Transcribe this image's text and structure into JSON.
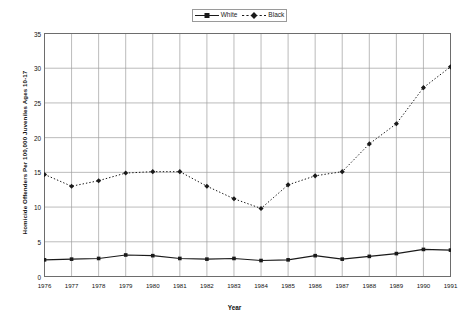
{
  "chart_data": {
    "type": "line",
    "title": "",
    "xlabel": "Year",
    "ylabel": "Homicide Offenders Per 100,000 Juveniles Ages 10-17",
    "categories": [
      1976,
      1977,
      1978,
      1979,
      1980,
      1981,
      1982,
      1983,
      1984,
      1985,
      1986,
      1987,
      1988,
      1989,
      1990,
      1991
    ],
    "xlim": [
      1976,
      1991
    ],
    "ylim": [
      0,
      35
    ],
    "yticks": [
      0,
      5,
      10,
      15,
      20,
      25,
      30,
      35
    ],
    "xticks": [
      "1976",
      "1977",
      "1978",
      "1979",
      "1980",
      "1981",
      "1982",
      "1983",
      "1984",
      "1985",
      "1986",
      "1987",
      "1988",
      "1989",
      "1990",
      "1991"
    ],
    "grid": "both",
    "legend_position": "top-center",
    "series": [
      {
        "name": "White",
        "line_style": "solid",
        "marker": "square",
        "color": "#1a1a1a",
        "values": [
          2.4,
          2.5,
          2.6,
          3.1,
          3.0,
          2.6,
          2.5,
          2.6,
          2.3,
          2.4,
          3.0,
          2.5,
          2.9,
          3.3,
          3.9,
          3.8
        ]
      },
      {
        "name": "Black",
        "line_style": "dotted",
        "marker": "diamond",
        "color": "#1a1a1a",
        "values": [
          14.7,
          13.0,
          13.8,
          14.9,
          15.1,
          15.1,
          13.0,
          11.2,
          9.8,
          13.2,
          14.5,
          15.1,
          19.1,
          22.0,
          27.2,
          30.2
        ]
      }
    ]
  },
  "legend": {
    "items": [
      {
        "label": "White"
      },
      {
        "label": "Black"
      }
    ]
  },
  "axis": {
    "x_title": "Year",
    "y_title": "Homicide Offenders Per 100,000 Juveniles Ages 10-17"
  }
}
